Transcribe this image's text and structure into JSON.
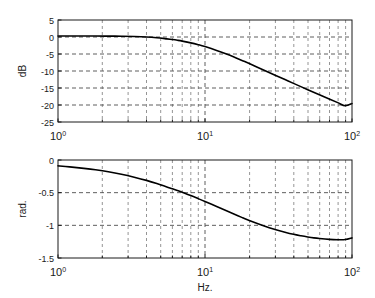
{
  "figure": {
    "background_color": "#ffffff",
    "curve_color": "#000000",
    "grid_color": "#4d4d4d",
    "axis_color": "#1a1a1a"
  },
  "xaxis": {
    "label": "Hz.",
    "scale": "log",
    "min": 1,
    "max": 100,
    "major_ticks": [
      "10",
      "10",
      "10"
    ],
    "major_tick_exponents": [
      "0",
      "1",
      "2"
    ],
    "minor_ticks": [
      2,
      3,
      4,
      5,
      6,
      7,
      8,
      9,
      20,
      30,
      40,
      50,
      60,
      70,
      80,
      90
    ]
  },
  "magnitude": {
    "ylabel": "dB",
    "yticks": [
      "5",
      "0",
      "-5",
      "-10",
      "-15",
      "-20",
      "-25"
    ],
    "ymin": -25,
    "ymax": 5
  },
  "phase": {
    "ylabel": "rad.",
    "yticks": [
      "0",
      "-0.5",
      "-1",
      "-1.5"
    ],
    "ymin": -1.5,
    "ymax": 0
  },
  "chart_data": [
    {
      "type": "line",
      "title": "",
      "xlabel": "",
      "ylabel": "dB",
      "xscale": "log",
      "xlim": [
        1,
        100
      ],
      "ylim": [
        -25,
        5
      ],
      "grid": true,
      "legend": null,
      "x": [
        1.0,
        1.2,
        1.5,
        1.8,
        2.2,
        2.7,
        3.3,
        4.0,
        4.7,
        5.5,
        6.0,
        6.5,
        7.0,
        8.0,
        9.0,
        10.0,
        12.0,
        14.0,
        16.0,
        18.0,
        20.0,
        25.0,
        30.0,
        35.0,
        40.0,
        50.0,
        60.0,
        70.0,
        80.0,
        90.0,
        100.0
      ],
      "values": [
        0.3,
        0.3,
        0.29,
        0.28,
        0.26,
        0.22,
        0.14,
        0.0,
        -0.22,
        -0.55,
        -0.75,
        -0.97,
        -1.21,
        -1.72,
        -2.26,
        -2.82,
        -3.94,
        -5.02,
        -6.03,
        -6.96,
        -7.82,
        -9.68,
        -11.22,
        -12.52,
        -13.64,
        -15.5,
        -16.99,
        -18.23,
        -19.3,
        -20.23,
        -19.55
      ]
    },
    {
      "type": "line",
      "title": "",
      "xlabel": "Hz.",
      "ylabel": "rad.",
      "xscale": "log",
      "xlim": [
        1,
        100
      ],
      "ylim": [
        -1.5,
        0
      ],
      "grid": true,
      "legend": null,
      "x": [
        1.0,
        1.2,
        1.5,
        1.8,
        2.2,
        2.7,
        3.3,
        4.0,
        4.7,
        5.5,
        6.0,
        6.5,
        7.0,
        8.0,
        9.0,
        10.0,
        12.0,
        14.0,
        16.0,
        18.0,
        20.0,
        25.0,
        30.0,
        35.0,
        40.0,
        45.0,
        50.0,
        55.0,
        60.0,
        70.0,
        80.0,
        90.0,
        100.0
      ],
      "values": [
        -0.09,
        -0.105,
        -0.128,
        -0.15,
        -0.18,
        -0.218,
        -0.263,
        -0.312,
        -0.36,
        -0.412,
        -0.44,
        -0.468,
        -0.495,
        -0.545,
        -0.592,
        -0.635,
        -0.712,
        -0.778,
        -0.835,
        -0.883,
        -0.925,
        -1.005,
        -1.063,
        -1.105,
        -1.137,
        -1.16,
        -1.178,
        -1.192,
        -1.202,
        -1.215,
        -1.22,
        -1.218,
        -1.192
      ]
    }
  ]
}
